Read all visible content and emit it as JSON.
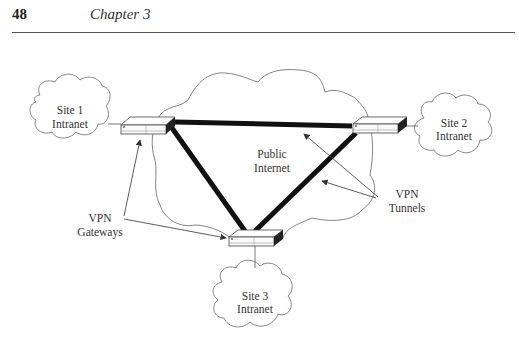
{
  "header": {
    "page_number": "48",
    "chapter": "Chapter 3"
  },
  "diagram": {
    "sites": [
      {
        "line1": "Site 1",
        "line2": "Intranet"
      },
      {
        "line1": "Site 2",
        "line2": "Intranet"
      },
      {
        "line1": "Site 3",
        "line2": "Intranet"
      }
    ],
    "public_internet": {
      "line1": "Public",
      "line2": "Internet"
    },
    "vpn_gateways": {
      "line1": "VPN",
      "line2": "Gateways"
    },
    "vpn_tunnels": {
      "line1": "VPN",
      "line2": "Tunnels"
    }
  }
}
